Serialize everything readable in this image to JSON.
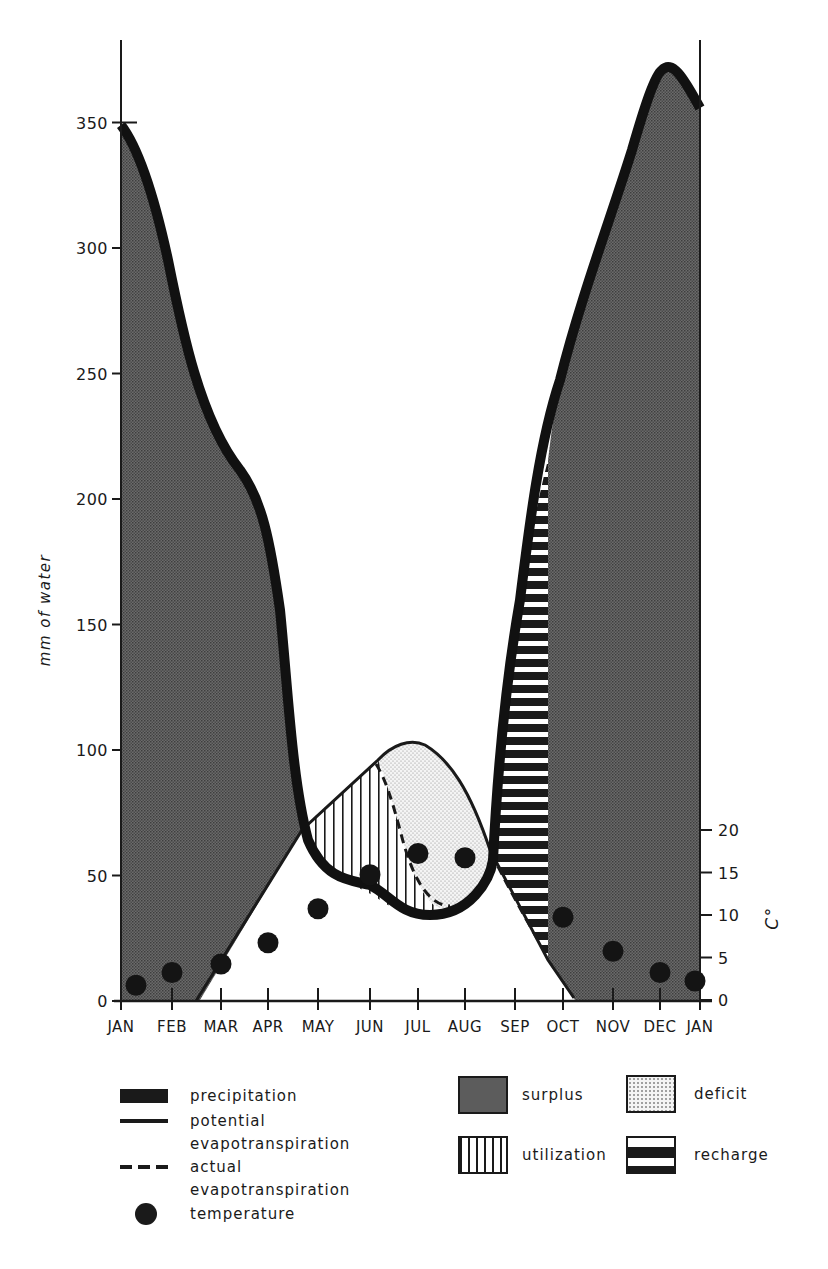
{
  "chart_data": {
    "type": "area",
    "title": "",
    "ylabel": "mm of water",
    "y2label": "C°",
    "xlabel": "",
    "ylim": [
      0,
      370
    ],
    "y2lim": [
      0,
      20
    ],
    "yticks": [
      0,
      50,
      100,
      150,
      200,
      250,
      300,
      350
    ],
    "y2ticks": [
      0,
      5,
      10,
      15,
      20
    ],
    "grid": false,
    "categories": [
      "JAN",
      "FEB",
      "MAR",
      "APR",
      "MAY",
      "JUN",
      "JUL",
      "AUG",
      "SEP",
      "OCT",
      "NOV",
      "DEC",
      "JAN"
    ],
    "series": [
      {
        "name": "precipitation",
        "unit": "mm",
        "values": [
          350,
          310,
          220,
          190,
          65,
          45,
          38,
          40,
          115,
          250,
          340,
          365,
          350
        ]
      },
      {
        "name": "potential evapotranspiration",
        "unit": "mm",
        "values": [
          0,
          0,
          20,
          45,
          70,
          95,
          102,
          90,
          55,
          10,
          0,
          0,
          0
        ]
      },
      {
        "name": "actual evapotranspiration",
        "unit": "mm",
        "values": [
          0,
          0,
          20,
          45,
          65,
          88,
          50,
          40,
          55,
          10,
          0,
          0,
          0
        ]
      },
      {
        "name": "temperature",
        "unit": "°C",
        "values": [
          1.5,
          3,
          4,
          6.5,
          10.5,
          14.5,
          17,
          16.5,
          null,
          9.5,
          5.5,
          3,
          2
        ]
      }
    ],
    "areas": [
      "surplus",
      "deficit",
      "utilization",
      "recharge"
    ],
    "legend_position": "bottom"
  },
  "legend": {
    "lines": [
      {
        "label": "precipitation",
        "icon": "thick-bar-icon"
      },
      {
        "label": "potential",
        "label2": "evapotranspiration",
        "icon": "solid-line-icon"
      },
      {
        "label": "actual",
        "label2": "evapotranspiration",
        "icon": "dashed-line-icon"
      },
      {
        "label": "temperature",
        "icon": "filled-dot-icon"
      }
    ],
    "areas": [
      {
        "label": "surplus",
        "icon": "dense-dot-pattern-icon"
      },
      {
        "label": "deficit",
        "icon": "light-dot-pattern-icon"
      },
      {
        "label": "utilization",
        "icon": "vertical-hatch-icon"
      },
      {
        "label": "recharge",
        "icon": "horizontal-bar-pattern-icon"
      }
    ]
  },
  "colors": {
    "ink": "#1a1a1a",
    "surplus": "#5a5a5a",
    "deficit": "#ececec",
    "paper": "#ffffff"
  }
}
